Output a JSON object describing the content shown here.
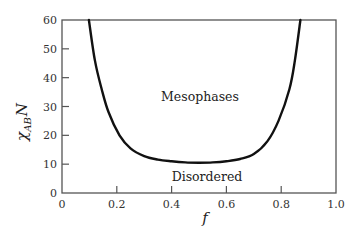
{
  "chart_data": {
    "type": "line",
    "title": "",
    "xlabel": "f",
    "ylabel": "χ_AB N",
    "ylabel_parts": {
      "symbol": "χ",
      "subscript": "AB",
      "suffix": "N"
    },
    "xlim": [
      0,
      1.0
    ],
    "ylim": [
      0,
      60
    ],
    "xticks": [
      0,
      0.2,
      0.4,
      0.6,
      0.8,
      1.0
    ],
    "xtick_labels": [
      "0",
      "0.2",
      "0.4",
      "0.6",
      "0.8",
      "1.0"
    ],
    "yticks": [
      0,
      10,
      20,
      30,
      40,
      50,
      60
    ],
    "ytick_labels": [
      "0",
      "10",
      "20",
      "30",
      "40",
      "50",
      "60"
    ],
    "grid": false,
    "legend": null,
    "series": [
      {
        "name": "Order-disorder transition",
        "x": [
          0.098,
          0.12,
          0.145,
          0.17,
          0.21,
          0.25,
          0.3,
          0.35,
          0.4,
          0.45,
          0.5,
          0.55,
          0.6,
          0.65,
          0.7,
          0.75,
          0.79,
          0.83,
          0.85,
          0.87
        ],
        "y": [
          60,
          46,
          36,
          28,
          20,
          15.5,
          12.8,
          11.6,
          11.0,
          10.6,
          10.5,
          10.6,
          11.0,
          11.8,
          13.5,
          18,
          25,
          36,
          46,
          60
        ]
      }
    ],
    "annotations": [
      {
        "text": "Mesophases",
        "x": 0.42,
        "y": 33
      },
      {
        "text": "Disordered",
        "x": 0.45,
        "y": 4
      }
    ]
  },
  "labels": {
    "mesophases": "Mesophases",
    "disordered": "Disordered",
    "xlabel": "f",
    "ylabel_symbol": "χ",
    "ylabel_sub": "AB",
    "ylabel_suffix": "N"
  },
  "colors": {
    "curve": "#111111",
    "axes": "#555555",
    "text": "#222222"
  }
}
